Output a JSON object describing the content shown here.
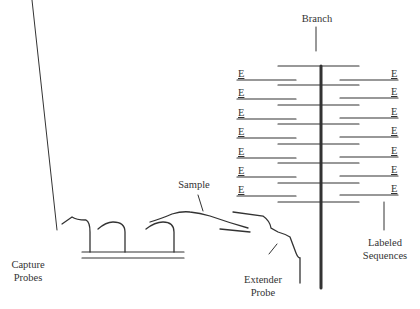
{
  "diagram": {
    "labels": {
      "branch": "Branch",
      "sample": "Sample",
      "capture_probes_line1": "Capture",
      "capture_probes_line2": "Probes",
      "extender_probe_line1": "Extender",
      "extender_probe_line2": "Probe",
      "labeled_sequences_line1": "Labeled",
      "labeled_sequences_line2": "Sequences"
    },
    "label_marks": {
      "left": [
        "E",
        "E",
        "E",
        "E",
        "E",
        "E",
        "E"
      ],
      "right": [
        "E",
        "E",
        "E",
        "E",
        "E",
        "E",
        "E"
      ]
    },
    "colors": {
      "line": "#333333",
      "text": "#333333",
      "background": "#ffffff"
    }
  }
}
